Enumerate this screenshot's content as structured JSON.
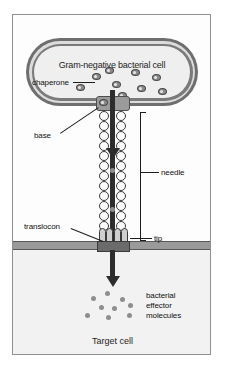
{
  "figure": {
    "type": "biology-diagram"
  },
  "bacterial_cell": {
    "title": "Gram-negative bacterial cell",
    "chaperone_label": "chaperone",
    "chaperone_count": 9
  },
  "injectisome": {
    "base_label": "base",
    "needle_label": "needle",
    "tip_label": "tip",
    "translocon_label": "translocon"
  },
  "target_cell": {
    "title": "Target cell",
    "effector_label_line1": "bacterial",
    "effector_label_line2": "effector",
    "effector_label_line3": "molecules",
    "effector_count": 9
  },
  "colors": {
    "outer_membrane": "#6e6e6e",
    "periplasm": "#dcdcdc",
    "inner_membrane": "#7a7a7a",
    "cytoplasm": "#efefef",
    "channel": "#2d2d2d",
    "needle_bead": "#fbfbfb",
    "base_block": "#9b9b9b",
    "target_membrane": "#9a9a9a",
    "target_cytoplasm": "#f2f2f2",
    "effector": "#8e8e8e",
    "frame_border": "#8f8f8f"
  }
}
